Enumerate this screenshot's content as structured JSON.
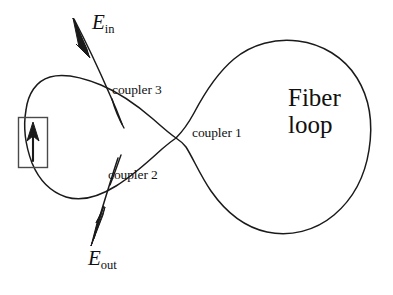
{
  "figure": {
    "background_color": "#ffffff",
    "stroke_color": "#1a1a1a",
    "text_color": "#111111",
    "width": 393,
    "height": 295
  },
  "labels": {
    "input_field": {
      "symbol": "E",
      "subscript": "in"
    },
    "output_field": {
      "symbol": "E",
      "subscript": "out"
    },
    "coupler_1": "coupler 1",
    "coupler_2": "coupler 2",
    "coupler_3": "coupler 3",
    "fiber_loop_line1": "Fiber",
    "fiber_loop_line2": "loop"
  },
  "components": {
    "modulator_box": {
      "name": "rectangular element on left loop",
      "arrow_direction": "up"
    },
    "left_loop": "small fiber loop",
    "right_loop": "large fiber loop",
    "input_arrow_direction": "down-right",
    "output_arrow_direction": "down-left"
  }
}
